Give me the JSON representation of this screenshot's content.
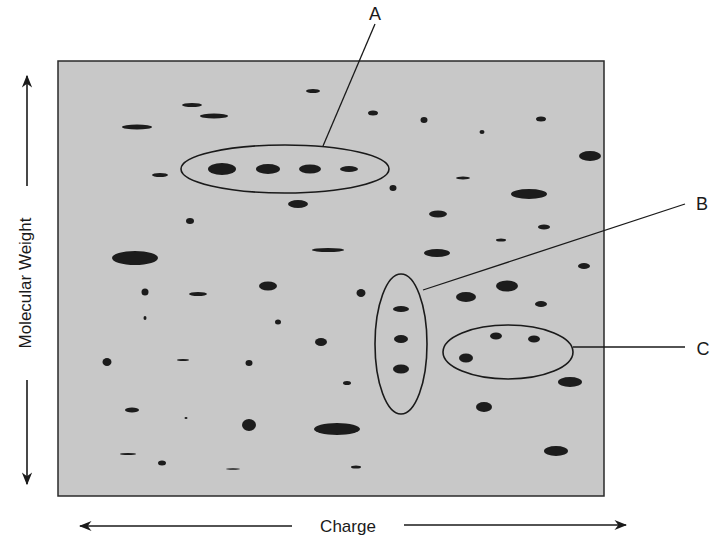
{
  "figure": {
    "type": "2D gel electrophoresis schematic",
    "colors": {
      "gel_fill": "#c8c8c8",
      "gel_border": "#2a2a2a",
      "spot": "#1c1c1c",
      "line": "#1a1a1a",
      "background": "#ffffff"
    },
    "gel": {
      "x": 58,
      "y": 61,
      "width": 546,
      "height": 435
    }
  },
  "axes": {
    "y_label": "Molecular Weight",
    "x_label": "Charge"
  },
  "callouts": [
    {
      "id": "A",
      "label": "A",
      "ellipse": {
        "cx": 285,
        "cy": 169,
        "rx": 104,
        "ry": 24
      },
      "leader": [
        [
          323,
          146
        ],
        [
          375,
          24
        ]
      ],
      "text_pos": [
        375,
        20
      ]
    },
    {
      "id": "B",
      "label": "B",
      "ellipse": {
        "cx": 401,
        "cy": 344,
        "rx": 26,
        "ry": 70
      },
      "leader": [
        [
          423,
          290
        ],
        [
          685,
          204
        ]
      ],
      "text_pos": [
        702,
        210
      ]
    },
    {
      "id": "C",
      "label": "C",
      "ellipse": {
        "cx": 508,
        "cy": 352,
        "rx": 65,
        "ry": 27
      },
      "leader": [
        [
          573,
          347
        ],
        [
          685,
          347
        ]
      ],
      "text_pos": [
        703,
        355
      ]
    }
  ],
  "spots": [
    {
      "cx": 192,
      "cy": 105,
      "rx": 10,
      "ry": 2
    },
    {
      "cx": 214,
      "cy": 116,
      "rx": 14,
      "ry": 2.5
    },
    {
      "cx": 137,
      "cy": 127,
      "rx": 15,
      "ry": 2.5
    },
    {
      "cx": 313,
      "cy": 91,
      "rx": 7,
      "ry": 2
    },
    {
      "cx": 373,
      "cy": 113,
      "rx": 5,
      "ry": 2.5
    },
    {
      "cx": 424,
      "cy": 120,
      "rx": 3.5,
      "ry": 3
    },
    {
      "cx": 482,
      "cy": 132,
      "rx": 2.5,
      "ry": 2
    },
    {
      "cx": 541,
      "cy": 119,
      "rx": 5,
      "ry": 2.5
    },
    {
      "cx": 590,
      "cy": 156,
      "rx": 11,
      "ry": 5
    },
    {
      "cx": 160,
      "cy": 175,
      "rx": 8,
      "ry": 2
    },
    {
      "cx": 222,
      "cy": 169,
      "rx": 14,
      "ry": 6
    },
    {
      "cx": 268,
      "cy": 169,
      "rx": 12,
      "ry": 5
    },
    {
      "cx": 310,
      "cy": 169,
      "rx": 11,
      "ry": 4.5
    },
    {
      "cx": 349,
      "cy": 169,
      "rx": 9,
      "ry": 3
    },
    {
      "cx": 298,
      "cy": 204,
      "rx": 10,
      "ry": 4
    },
    {
      "cx": 393,
      "cy": 188,
      "rx": 3.5,
      "ry": 3
    },
    {
      "cx": 463,
      "cy": 178,
      "rx": 7,
      "ry": 1.5
    },
    {
      "cx": 529,
      "cy": 194,
      "rx": 18,
      "ry": 5
    },
    {
      "cx": 190,
      "cy": 221,
      "rx": 4,
      "ry": 3
    },
    {
      "cx": 328,
      "cy": 250,
      "rx": 16,
      "ry": 2
    },
    {
      "cx": 438,
      "cy": 214,
      "rx": 9,
      "ry": 3.5
    },
    {
      "cx": 544,
      "cy": 227,
      "rx": 6,
      "ry": 2.5
    },
    {
      "cx": 135,
      "cy": 258,
      "rx": 23,
      "ry": 7
    },
    {
      "cx": 268,
      "cy": 286,
      "rx": 9,
      "ry": 4.5
    },
    {
      "cx": 437,
      "cy": 253,
      "rx": 13,
      "ry": 4
    },
    {
      "cx": 501,
      "cy": 240,
      "rx": 5,
      "ry": 1.5
    },
    {
      "cx": 584,
      "cy": 266,
      "rx": 6,
      "ry": 3
    },
    {
      "cx": 145,
      "cy": 292,
      "rx": 3.5,
      "ry": 3.5
    },
    {
      "cx": 198,
      "cy": 294,
      "rx": 9,
      "ry": 2
    },
    {
      "cx": 361,
      "cy": 293,
      "rx": 4.5,
      "ry": 4
    },
    {
      "cx": 145,
      "cy": 318,
      "rx": 1.5,
      "ry": 2
    },
    {
      "cx": 278,
      "cy": 322,
      "rx": 3,
      "ry": 2.5
    },
    {
      "cx": 401,
      "cy": 309,
      "rx": 8,
      "ry": 3
    },
    {
      "cx": 401,
      "cy": 339,
      "rx": 7,
      "ry": 4
    },
    {
      "cx": 401,
      "cy": 369,
      "rx": 8,
      "ry": 4.5
    },
    {
      "cx": 466,
      "cy": 297,
      "rx": 10,
      "ry": 5
    },
    {
      "cx": 507,
      "cy": 286,
      "rx": 11,
      "ry": 5.5
    },
    {
      "cx": 541,
      "cy": 304,
      "rx": 6,
      "ry": 3
    },
    {
      "cx": 496,
      "cy": 336,
      "rx": 6,
      "ry": 3.5
    },
    {
      "cx": 534,
      "cy": 339,
      "rx": 6,
      "ry": 3.5
    },
    {
      "cx": 466,
      "cy": 358,
      "rx": 7,
      "ry": 4.5
    },
    {
      "cx": 321,
      "cy": 342,
      "rx": 6,
      "ry": 4
    },
    {
      "cx": 107,
      "cy": 362,
      "rx": 4.5,
      "ry": 4
    },
    {
      "cx": 183,
      "cy": 360,
      "rx": 6,
      "ry": 1
    },
    {
      "cx": 249,
      "cy": 363,
      "rx": 3.5,
      "ry": 3
    },
    {
      "cx": 347,
      "cy": 383,
      "rx": 4,
      "ry": 2
    },
    {
      "cx": 570,
      "cy": 382,
      "rx": 12,
      "ry": 5
    },
    {
      "cx": 132,
      "cy": 410,
      "rx": 7,
      "ry": 2.5
    },
    {
      "cx": 186,
      "cy": 418,
      "rx": 1.5,
      "ry": 1
    },
    {
      "cx": 249,
      "cy": 425,
      "rx": 7,
      "ry": 6
    },
    {
      "cx": 337,
      "cy": 429,
      "rx": 23,
      "ry": 6
    },
    {
      "cx": 484,
      "cy": 407,
      "rx": 8,
      "ry": 5
    },
    {
      "cx": 556,
      "cy": 451,
      "rx": 12,
      "ry": 5
    },
    {
      "cx": 128,
      "cy": 454,
      "rx": 8,
      "ry": 1
    },
    {
      "cx": 162,
      "cy": 463,
      "rx": 4,
      "ry": 2.5
    },
    {
      "cx": 233,
      "cy": 469,
      "rx": 7,
      "ry": 0.8
    },
    {
      "cx": 356,
      "cy": 467,
      "rx": 5,
      "ry": 1.5
    }
  ]
}
